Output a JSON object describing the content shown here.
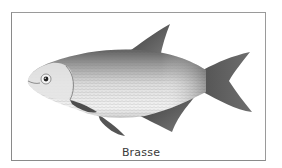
{
  "figure": {
    "caption": "Brasse",
    "colors": {
      "frame": "#8a8a8a",
      "fin": "#555555",
      "body_light": "#e8e8e8",
      "body_dark": "#6a6a6a",
      "caption": "#3a3a3a"
    }
  }
}
